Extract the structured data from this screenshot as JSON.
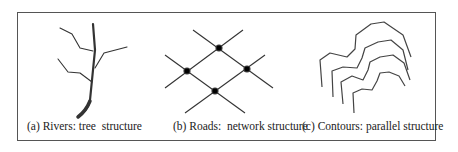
{
  "figure": {
    "panels": [
      {
        "id": "a",
        "caption": "(a) Rivers: tree  structure",
        "subject": "Rivers",
        "structure": "tree"
      },
      {
        "id": "b",
        "caption": "(b) Roads:  network structure",
        "subject": "Roads",
        "structure": "network"
      },
      {
        "id": "c",
        "caption": "(c) Contours: parallel structure",
        "subject": "Contours",
        "structure": "parallel"
      }
    ],
    "colors": {
      "line": "#333333",
      "node": "#000000",
      "border": "#555555"
    }
  }
}
